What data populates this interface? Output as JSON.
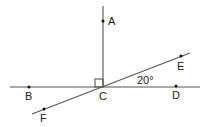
{
  "diagram": {
    "type": "geometry",
    "lines": [
      {
        "name": "ray-CA",
        "from": [
          103,
          6
        ],
        "to": [
          103,
          87
        ]
      },
      {
        "name": "line-BD",
        "from": [
          10,
          87
        ],
        "to": [
          200,
          87
        ]
      },
      {
        "name": "line-FE",
        "from": [
          32,
          114
        ],
        "to": [
          190,
          53
        ]
      }
    ],
    "points": [
      {
        "label": "A",
        "x": 103,
        "y": 21,
        "lx": 108,
        "ly": 25
      },
      {
        "label": "B",
        "x": 29,
        "y": 87,
        "lx": 25,
        "ly": 100
      },
      {
        "label": "C",
        "x": 103,
        "y": 87,
        "lx": 99,
        "ly": 100
      },
      {
        "label": "D",
        "x": 176,
        "y": 86,
        "lx": 172,
        "ly": 99
      },
      {
        "label": "E",
        "x": 181,
        "y": 56,
        "lx": 177,
        "ly": 70
      },
      {
        "label": "F",
        "x": 44,
        "y": 109,
        "lx": 40,
        "ly": 122
      }
    ],
    "right_angle_mark": {
      "x": 95,
      "y": 79,
      "size": 8
    },
    "angle_label": {
      "text": "20°",
      "x": 137,
      "y": 84
    }
  }
}
